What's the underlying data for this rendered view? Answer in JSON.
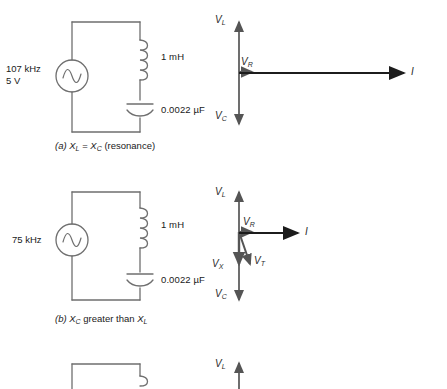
{
  "figure": {
    "type": "series-rlc-circuit-phasor-diagram",
    "line_color": "#6f6f6f",
    "phasor_color": "#555555",
    "text_color": "#1a1a1a"
  },
  "sections": [
    {
      "id": "a",
      "caption_prefix": "(a)",
      "caption_text": "X_L  =  X_C   (resonance)",
      "caption_parts": {
        "lead": "(a)",
        "vl": "X",
        "vl_sub": "L",
        "eq": "=",
        "vc": "X",
        "vc_sub": "C",
        "tail": "(resonance)"
      },
      "source": {
        "frequency": "107 kHz",
        "voltage": "5 V"
      },
      "components": {
        "inductor": "1 mH",
        "capacitor": "0.0022 µF"
      },
      "phasors": {
        "vl": "V",
        "vl_sub": "L",
        "vc": "V",
        "vc_sub": "C",
        "vr": "V",
        "vr_sub": "R",
        "i": "I"
      }
    },
    {
      "id": "b",
      "caption_prefix": "(b)",
      "caption_text": "X_C greater than X_L",
      "caption_parts": {
        "lead": "(b)",
        "vc": "X",
        "vc_sub": "C",
        "mid": "greater than",
        "vl": "X",
        "vl_sub": "L"
      },
      "source": {
        "frequency": "75 kHz",
        "voltage": ""
      },
      "components": {
        "inductor": "1 mH",
        "capacitor": "0.0022 µF"
      },
      "phasors": {
        "vl": "V",
        "vl_sub": "L",
        "vc": "V",
        "vc_sub": "C",
        "vr": "V",
        "vr_sub": "R",
        "vx": "V",
        "vx_sub": "X",
        "vt": "V",
        "vt_sub": "T",
        "i": "I"
      }
    },
    {
      "id": "c",
      "caption_prefix": "",
      "caption_text": "",
      "clipped": true,
      "phasors": {
        "vl": "V",
        "vl_sub": "L"
      }
    }
  ]
}
